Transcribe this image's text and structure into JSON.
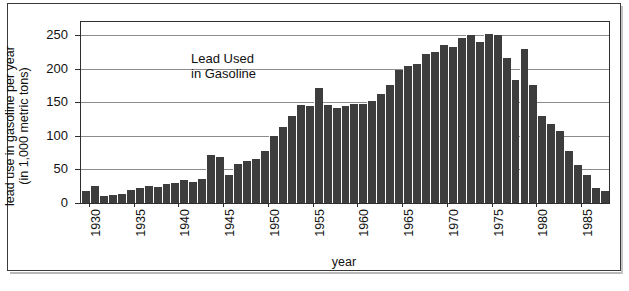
{
  "figure": {
    "annotation_line1": "Lead Used",
    "annotation_line2": "in Gasoline",
    "frame_color": "#3a3a3a",
    "bar_color": "#3d3d3d",
    "grid_color": "#8c8c8c"
  },
  "chart_data": {
    "type": "bar",
    "title": "Lead Used in Gasoline",
    "xlabel": "year",
    "ylabel": "lead use in gasoline per year (in 1,000 metric tons)",
    "ylabel_line1": "lead use in gasoline per year",
    "ylabel_line2": "(in 1,000 metric tons)",
    "ylim": [
      0,
      270
    ],
    "yticks": [
      0,
      50,
      100,
      150,
      200,
      250
    ],
    "ytick_labels": [
      "0",
      "50",
      "100",
      "150",
      "200",
      "250"
    ],
    "xticks": [
      1930,
      1935,
      1940,
      1945,
      1950,
      1955,
      1960,
      1965,
      1970,
      1975,
      1980,
      1985
    ],
    "xtick_labels": [
      "1930",
      "1935",
      "1940",
      "1945",
      "1950",
      "1955",
      "1960",
      "1965",
      "1970",
      "1975",
      "1980",
      "1985"
    ],
    "xlim": [
      1929.5,
      1988.5
    ],
    "grid": true,
    "grid_axis": "y",
    "legend": false,
    "categories": [
      1930,
      1931,
      1932,
      1933,
      1934,
      1935,
      1936,
      1937,
      1938,
      1939,
      1940,
      1941,
      1942,
      1943,
      1944,
      1945,
      1946,
      1947,
      1948,
      1949,
      1950,
      1951,
      1952,
      1953,
      1954,
      1955,
      1956,
      1957,
      1958,
      1959,
      1960,
      1961,
      1962,
      1963,
      1964,
      1965,
      1966,
      1967,
      1968,
      1969,
      1970,
      1971,
      1972,
      1973,
      1974,
      1975,
      1976,
      1977,
      1978,
      1979,
      1980,
      1981,
      1982,
      1983,
      1984,
      1985,
      1986,
      1987,
      1988
    ],
    "values": [
      18,
      26,
      10,
      12,
      14,
      19,
      22,
      25,
      24,
      28,
      30,
      35,
      32,
      36,
      72,
      68,
      42,
      58,
      62,
      66,
      78,
      100,
      114,
      130,
      146,
      144,
      172,
      146,
      142,
      144,
      148,
      148,
      152,
      162,
      176,
      198,
      204,
      208,
      222,
      226,
      236,
      232,
      246,
      250,
      240,
      252,
      250,
      216,
      184,
      230,
      176,
      130,
      118,
      108,
      78,
      56,
      42,
      22,
      18
    ]
  }
}
